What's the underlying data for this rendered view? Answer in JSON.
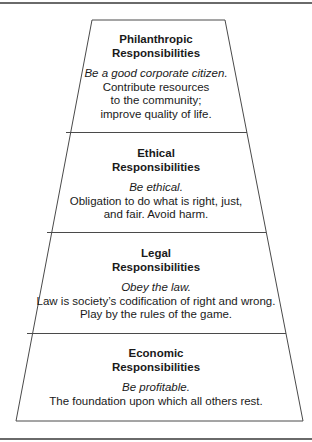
{
  "diagram": {
    "type": "pyramid",
    "stroke_color": "#4a4a4a",
    "tiers": [
      {
        "title_line1": "Philanthropic",
        "title_line2": "Responsibilities",
        "motto": "Be a good corporate citizen.",
        "body_lines": [
          "Contribute resources",
          "to the community;",
          "improve quality of life."
        ]
      },
      {
        "title_line1": "Ethical",
        "title_line2": "Responsibilities",
        "motto": "Be ethical.",
        "body_lines": [
          "Obligation to do what is right, just,",
          "and fair. Avoid harm."
        ]
      },
      {
        "title_line1": "Legal",
        "title_line2": "Responsibilities",
        "motto": "Obey the law.",
        "body_lines": [
          "Law is society’s codification of right and wrong.",
          "Play by the rules of the game."
        ]
      },
      {
        "title_line1": "Economic",
        "title_line2": "Responsibilities",
        "motto": "Be profitable.",
        "body_lines": [
          "The foundation upon which all others rest."
        ]
      }
    ]
  }
}
